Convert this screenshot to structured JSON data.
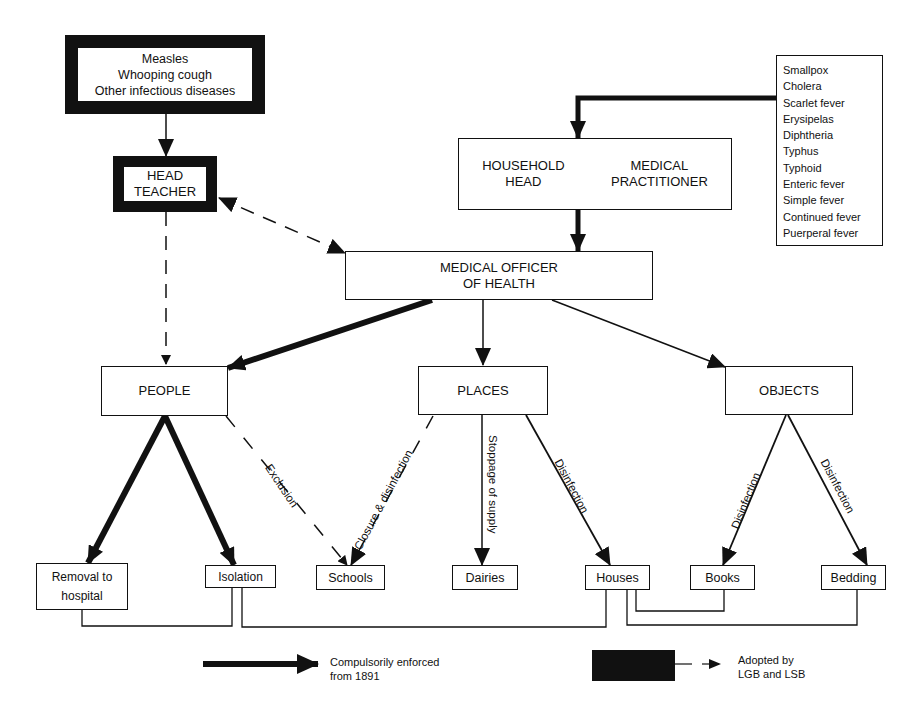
{
  "nodes": {
    "diseases_left": {
      "lines": [
        "Measles",
        "Whooping cough",
        "Other infectious diseases"
      ]
    },
    "head_teacher": {
      "lines": [
        "HEAD",
        "TEACHER"
      ]
    },
    "household": {
      "col1": [
        "HOUSEHOLD",
        "HEAD"
      ],
      "col2": [
        "MEDICAL",
        "PRACTITIONER"
      ]
    },
    "diseases_right": {
      "items": [
        "Smallpox",
        "Cholera",
        "Scarlet fever",
        "Erysipelas",
        "Diphtheria",
        "Typhus",
        "Typhoid",
        "Enteric fever",
        "Simple fever",
        "Continued fever",
        "Puerperal fever"
      ]
    },
    "moh": {
      "lines": [
        "MEDICAL OFFICER",
        "OF HEALTH"
      ]
    },
    "people": {
      "label": "PEOPLE"
    },
    "places": {
      "label": "PLACES"
    },
    "objects": {
      "label": "OBJECTS"
    },
    "removal": {
      "lines": [
        "Removal to",
        "hospital"
      ]
    },
    "isolation": {
      "label": "Isolation"
    },
    "schools": {
      "label": "Schools"
    },
    "dairies": {
      "label": "Dairies"
    },
    "houses": {
      "label": "Houses"
    },
    "books": {
      "label": "Books"
    },
    "bedding": {
      "label": "Bedding"
    }
  },
  "edge_labels": {
    "exclusion": "Exclusion",
    "closure": "Closure & disinfection",
    "stoppage": "Stoppage of supply",
    "places_houses": "Disinfection",
    "objects_books": "Disinfection",
    "objects_bedding": "Disinfection"
  },
  "legend": {
    "thick_arrow": {
      "lines": [
        "Compulsorily enforced",
        "from 1891"
      ]
    },
    "dashed": {
      "lines": [
        "Adopted by",
        "LGB and LSB"
      ]
    }
  },
  "colors": {
    "ink": "#111111",
    "paper": "#ffffff"
  }
}
